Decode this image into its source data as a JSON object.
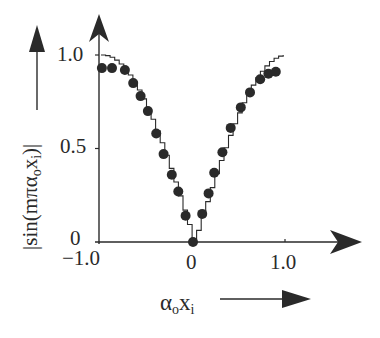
{
  "chart_data": {
    "type": "scatter",
    "title": "",
    "xlabel": "αoxi",
    "xlabel_parts": {
      "main": "α",
      "sub1": "o",
      "mid": "x",
      "sub2": "i"
    },
    "ylabel": "|sin(mπαoxi)|",
    "ylabel_parts": {
      "pre": "|sin(mπα",
      "sub1": "o",
      "mid": "x",
      "sub2": "i",
      "post": ")|"
    },
    "x_ticks": [
      "−1.0",
      "0",
      "1.0"
    ],
    "y_ticks": [
      "0",
      "0.5",
      "1.0"
    ],
    "xlim": [
      -1.0,
      1.3
    ],
    "ylim": [
      0,
      1.1
    ],
    "grid": false,
    "legend": "none",
    "series": [
      {
        "name": "ideal |sin| (staircase line)",
        "style": "line-staircase",
        "x": [
          -1.0,
          -0.9,
          -0.8,
          -0.7,
          -0.6,
          -0.5,
          -0.4,
          -0.3,
          -0.2,
          -0.1,
          0.0,
          0.1,
          0.2,
          0.3,
          0.4,
          0.5,
          0.6,
          0.7,
          0.8,
          0.9,
          0.98
        ],
        "values": [
          1.0,
          0.98,
          0.95,
          0.89,
          0.81,
          0.71,
          0.59,
          0.45,
          0.31,
          0.16,
          0.0,
          0.16,
          0.31,
          0.45,
          0.59,
          0.71,
          0.81,
          0.89,
          0.95,
          0.98,
          1.0
        ]
      },
      {
        "name": "measured (dots)",
        "style": "marker-circle",
        "x": [
          -0.99,
          -0.88,
          -0.74,
          -0.65,
          -0.57,
          -0.49,
          -0.4,
          -0.32,
          -0.23,
          -0.16,
          -0.08,
          0.0,
          0.1,
          0.17,
          0.23,
          0.32,
          0.41,
          0.52,
          0.62,
          0.73,
          0.82,
          0.9
        ],
        "values": [
          0.93,
          0.93,
          0.92,
          0.85,
          0.78,
          0.7,
          0.58,
          0.47,
          0.36,
          0.27,
          0.14,
          0.0,
          0.15,
          0.26,
          0.37,
          0.48,
          0.61,
          0.72,
          0.8,
          0.87,
          0.9,
          0.91
        ]
      }
    ]
  },
  "colors": {
    "ink": "#2a2a2a",
    "background": "#ffffff"
  }
}
